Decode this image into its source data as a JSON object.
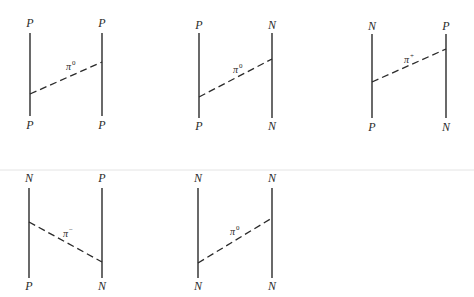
{
  "figure": {
    "diagrams": [
      {
        "id": "pp-pi0",
        "top_left": "P",
        "top_right": "P",
        "bottom_left": "P",
        "bottom_right": "P",
        "exchange": {
          "symbol": "π",
          "charge": "0"
        },
        "geometry": {
          "xl": 30,
          "xr": 102,
          "line_top": 33,
          "line_bottom": 116,
          "label_top_y": 27,
          "label_bottom_y": 129,
          "dash_from": [
            30,
            94
          ],
          "dash_to": [
            102,
            62
          ],
          "pion_label": [
            66,
            70
          ]
        }
      },
      {
        "id": "pn-pi0",
        "top_left": "P",
        "top_right": "N",
        "bottom_left": "P",
        "bottom_right": "N",
        "exchange": {
          "symbol": "π",
          "charge": "0"
        },
        "geometry": {
          "xl": 199,
          "xr": 272,
          "line_top": 33,
          "line_bottom": 118,
          "label_top_y": 29,
          "label_bottom_y": 130,
          "dash_from": [
            199,
            97
          ],
          "dash_to": [
            272,
            59
          ],
          "pion_label": [
            233,
            73
          ]
        }
      },
      {
        "id": "np-pi-plus",
        "top_left": "N",
        "top_right": "P",
        "bottom_left": "P",
        "bottom_right": "N",
        "exchange": {
          "symbol": "π",
          "charge": "+"
        },
        "geometry": {
          "xl": 372,
          "xr": 446,
          "line_top": 34,
          "line_bottom": 118,
          "label_top_y": 30,
          "label_bottom_y": 131,
          "dash_from": [
            372,
            82
          ],
          "dash_to": [
            446,
            49
          ],
          "pion_label": [
            404,
            63
          ]
        }
      },
      {
        "id": "np-pi-minus",
        "top_left": "N",
        "top_right": "P",
        "bottom_left": "P",
        "bottom_right": "N",
        "exchange": {
          "symbol": "π",
          "charge": "−"
        },
        "geometry": {
          "xl": 29,
          "xr": 102,
          "line_top": 188,
          "line_bottom": 278,
          "label_top_y": 182,
          "label_bottom_y": 290,
          "dash_from": [
            29,
            222
          ],
          "dash_to": [
            102,
            262
          ],
          "pion_label": [
            63,
            237
          ]
        }
      },
      {
        "id": "nn-pi0",
        "top_left": "N",
        "top_right": "N",
        "bottom_left": "N",
        "bottom_right": "N",
        "exchange": {
          "symbol": "π",
          "charge": "0"
        },
        "geometry": {
          "xl": 198,
          "xr": 272,
          "line_top": 188,
          "line_bottom": 278,
          "label_top_y": 182,
          "label_bottom_y": 290,
          "dash_from": [
            198,
            263
          ],
          "dash_to": [
            272,
            218
          ],
          "pion_label": [
            230,
            235
          ]
        }
      }
    ]
  },
  "colors": {
    "ink": "#2a2a2a",
    "background": "#ffffff",
    "artifact": "#e4e4e4"
  }
}
